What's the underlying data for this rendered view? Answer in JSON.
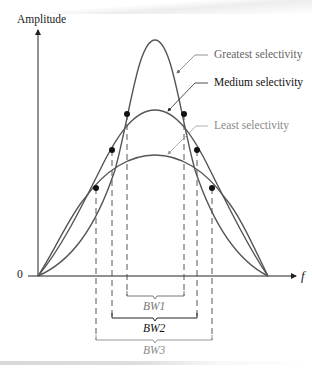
{
  "figure": {
    "y_axis_label": "Amplitude",
    "x_axis_label": "f",
    "origin_label": "0",
    "curves": [
      {
        "name": "Greatest selectivity",
        "color": "#555555",
        "label_color": "#666666",
        "bandwidth_label": "BW1",
        "bandwidth_color": "#777777"
      },
      {
        "name": "Medium selectivity",
        "color": "#555555",
        "label_color": "#111111",
        "bandwidth_label": "BW2",
        "bandwidth_color": "#111111"
      },
      {
        "name": "Least selectivity",
        "color": "#555555",
        "label_color": "#8a8a8a",
        "bandwidth_label": "BW3",
        "bandwidth_color": "#8a8a8a"
      }
    ],
    "half_power_points": "filled dots marking the bandwidth edges on each curve"
  }
}
